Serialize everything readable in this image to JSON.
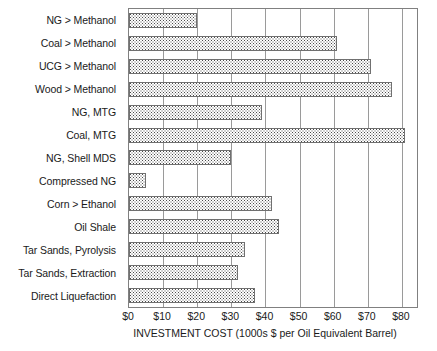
{
  "chart_data": {
    "type": "bar",
    "orientation": "horizontal",
    "title": "",
    "xlabel": "INVESTMENT COST (1000s $ per Oil Equivalent Barrel)",
    "ylabel": "",
    "xlim": [
      0,
      85
    ],
    "xticks": [
      0,
      10,
      20,
      30,
      40,
      50,
      60,
      70,
      80
    ],
    "xtick_labels": [
      "$0",
      "$10",
      "$20",
      "$30",
      "$40",
      "$50",
      "$60",
      "$70",
      "$80"
    ],
    "grid": "vertical",
    "legend": "none",
    "categories": [
      "NG > Methanol",
      "Coal > Methanol",
      "UCG > Methanol",
      "Wood > Methanol",
      "NG, MTG",
      "Coal, MTG",
      "NG, Shell MDS",
      "Compressed NG",
      "Corn > Ethanol",
      "Oil Shale",
      "Tar Sands, Pyrolysis",
      "Tar Sands, Extraction",
      "Direct Liquefaction"
    ],
    "values": [
      20,
      61,
      71,
      77,
      39,
      81,
      30,
      5,
      42,
      44,
      34,
      32,
      37
    ],
    "bar_fill": "#4a4a4a",
    "bar_edge": "#707070",
    "grid_color": "#9a9a9a",
    "frame_color": "#808080"
  }
}
